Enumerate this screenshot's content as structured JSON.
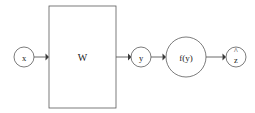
{
  "diagram": {
    "background_color": "#ffffff",
    "stroke_color": "#5a5a5a",
    "text_color": "#1c1c1c",
    "nodes": [
      {
        "id": "input",
        "label": "x",
        "accent": "",
        "shape": "circle",
        "cx": 24,
        "cy": 57,
        "r": 10
      },
      {
        "id": "weights",
        "label": "W",
        "accent": "",
        "shape": "rect",
        "x": 49,
        "y": 6,
        "width": 67,
        "height": 102
      },
      {
        "id": "preactivation",
        "label": "y",
        "accent": "",
        "shape": "circle",
        "cx": 141,
        "cy": 57,
        "r": 10
      },
      {
        "id": "activation",
        "label": "f(y)",
        "accent": "",
        "shape": "circle",
        "cx": 186,
        "cy": 57,
        "r": 20
      },
      {
        "id": "output",
        "label": "z",
        "accent": "^",
        "shape": "circle",
        "cx": 236,
        "cy": 57,
        "r": 10
      }
    ],
    "edges": [
      {
        "id": "x-to-w",
        "from": "input",
        "to": "weights",
        "x1": 34,
        "y1": 57,
        "x2": 47,
        "y2": 57
      },
      {
        "id": "w-to-y",
        "from": "weights",
        "to": "preactivation",
        "x1": 117,
        "y1": 57,
        "x2": 130,
        "y2": 57
      },
      {
        "id": "y-to-f",
        "from": "preactivation",
        "to": "activation",
        "x1": 151,
        "y1": 57,
        "x2": 165,
        "y2": 57
      },
      {
        "id": "f-to-z",
        "from": "activation",
        "to": "output",
        "x1": 206,
        "y1": 57,
        "x2": 225,
        "y2": 57
      }
    ]
  }
}
